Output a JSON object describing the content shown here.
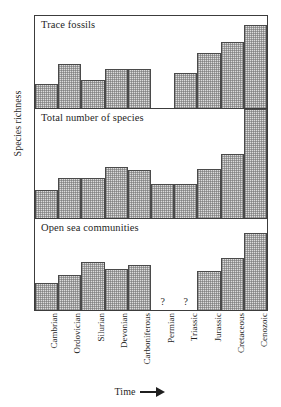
{
  "chart_data": {
    "type": "bar",
    "title": "",
    "xlabel": "Time",
    "ylabel": "Species richness",
    "grid": false,
    "legend": "none",
    "categories": [
      "Cambrian",
      "Ordovician",
      "Silurian",
      "Devonian",
      "Carboniferous",
      "Permian",
      "Triassic",
      "Jurassic",
      "Cretaceous",
      "Cenozoic"
    ],
    "panels": [
      {
        "label": "Trace fossils",
        "ylim": [
          0,
          100
        ],
        "values": [
          26,
          48,
          30,
          42,
          42,
          null,
          38,
          60,
          72,
          90
        ],
        "missing": [
          "Permian"
        ],
        "question_marks": []
      },
      {
        "label": "Total number of species",
        "ylim": [
          0,
          100
        ],
        "values": [
          26,
          37,
          37,
          47,
          44,
          31,
          31,
          45,
          59,
          100
        ],
        "missing": [],
        "question_marks": []
      },
      {
        "label": "Open sea communities",
        "ylim": [
          0,
          100
        ],
        "values": [
          30,
          38,
          53,
          45,
          50,
          null,
          null,
          43,
          57,
          85
        ],
        "missing": [
          "Permian",
          "Triassic"
        ],
        "question_marks": [
          "Permian",
          "Triassic"
        ]
      }
    ],
    "question_mark_glyph": "?",
    "axis_arrow": "→",
    "colors": {
      "bar_fill": "#dcdcdc",
      "bar_stroke": "#4a4a4a",
      "frame": "#3c3c3c",
      "text": "#1f1f1f",
      "background": "#ffffff"
    }
  }
}
